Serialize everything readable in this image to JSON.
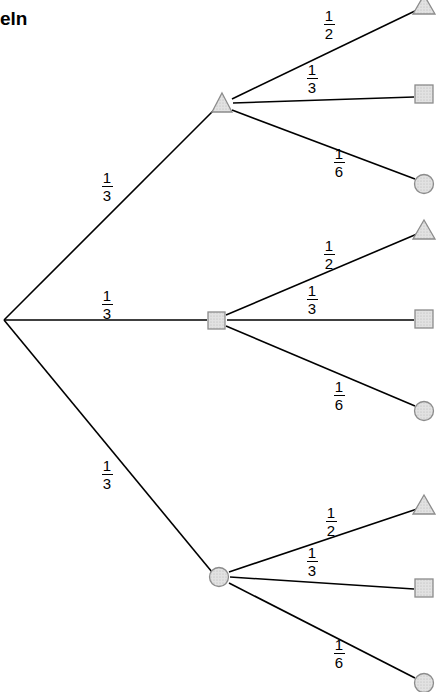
{
  "title": {
    "text": "eln"
  },
  "diagram": {
    "type": "probability-tree",
    "root": {
      "shape": "point",
      "x": 4,
      "y": 320
    },
    "level1": [
      {
        "shape": "triangle",
        "x": 222,
        "y": 104,
        "label": "1/3",
        "label_num": "1",
        "label_den": "3",
        "label_x": 95,
        "label_y": 170
      },
      {
        "shape": "square",
        "x": 216,
        "y": 320,
        "label": "1/3",
        "label_num": "1",
        "label_den": "3",
        "label_x": 95,
        "label_y": 288
      },
      {
        "shape": "circle",
        "x": 219,
        "y": 577,
        "label": "1/3",
        "label_num": "1",
        "label_den": "3",
        "label_x": 95,
        "label_y": 458
      }
    ],
    "level2": [
      {
        "parent": 0,
        "shape": "triangle",
        "x": 424,
        "y": 6,
        "label_num": "1",
        "label_den": "2",
        "label_x": 317,
        "label_y": 8
      },
      {
        "parent": 0,
        "shape": "square",
        "x": 424,
        "y": 93,
        "label_num": "1",
        "label_den": "3",
        "label_x": 300,
        "label_y": 62
      },
      {
        "parent": 0,
        "shape": "circle",
        "x": 424,
        "y": 184,
        "label_num": "1",
        "label_den": "6",
        "label_x": 327,
        "label_y": 146
      },
      {
        "parent": 1,
        "shape": "triangle",
        "x": 424,
        "y": 230,
        "label_num": "1",
        "label_den": "2",
        "label_x": 317,
        "label_y": 238
      },
      {
        "parent": 1,
        "shape": "square",
        "x": 424,
        "y": 318,
        "label_num": "1",
        "label_den": "3",
        "label_x": 300,
        "label_y": 283
      },
      {
        "parent": 1,
        "shape": "circle",
        "x": 424,
        "y": 411,
        "label_num": "1",
        "label_den": "6",
        "label_x": 327,
        "label_y": 379
      },
      {
        "parent": 2,
        "shape": "triangle",
        "x": 424,
        "y": 505,
        "label_num": "1",
        "label_den": "2",
        "label_x": 319,
        "label_y": 505
      },
      {
        "parent": 2,
        "shape": "square",
        "x": 424,
        "y": 587,
        "label_num": "1",
        "label_den": "3",
        "label_x": 300,
        "label_y": 545
      },
      {
        "parent": 2,
        "shape": "circle",
        "x": 424,
        "y": 683,
        "label_num": "1",
        "label_den": "6",
        "label_x": 327,
        "label_y": 637
      }
    ],
    "colors": {
      "line": "#000000",
      "node_stroke": "#8c8c8c",
      "node_fill": "#dcdcdc",
      "text": "#000000"
    }
  }
}
